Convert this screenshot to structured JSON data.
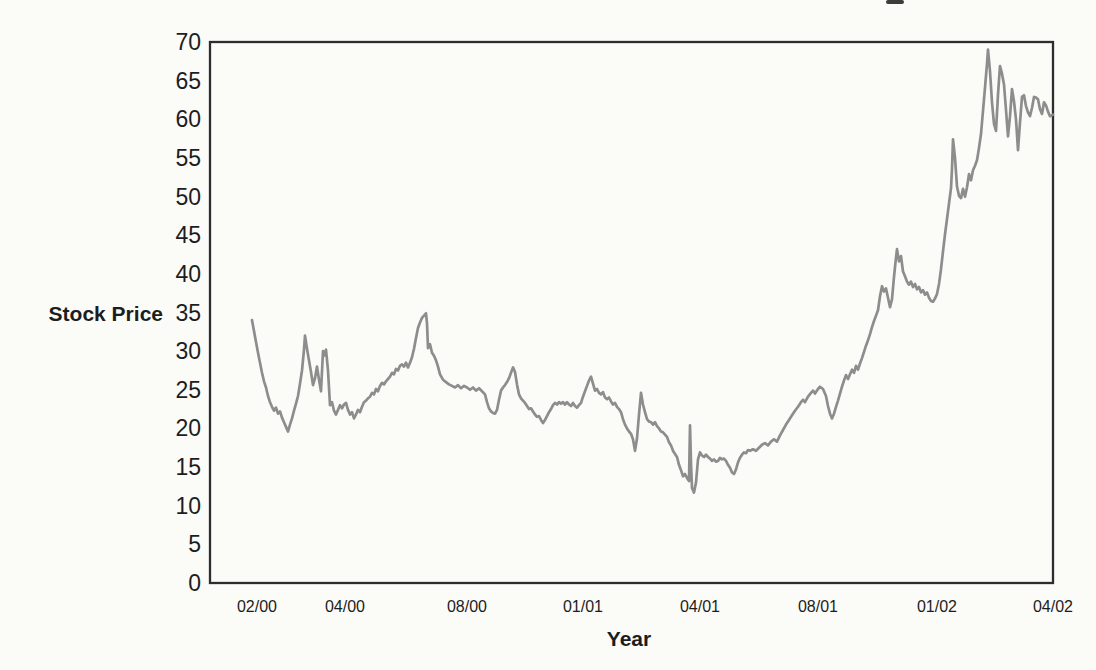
{
  "chart_data": {
    "type": "line",
    "title": "",
    "ylabel": "Stock Price",
    "xlabel": "Year",
    "ylim": [
      0,
      70
    ],
    "ytick_step": 5,
    "y_ticks": [
      0,
      5,
      10,
      15,
      20,
      25,
      30,
      35,
      40,
      45,
      50,
      55,
      60,
      65,
      70
    ],
    "x_tick_labels": [
      "02/00",
      "04/00",
      "08/00",
      "01/01",
      "04/01",
      "08/01",
      "01/02",
      "04/02"
    ],
    "x_tick_pos": [
      257,
      345,
      467,
      583,
      700,
      818,
      937,
      1053
    ],
    "x_domain": [
      210,
      1053
    ],
    "grid": false,
    "legend": "none",
    "colors": {
      "line": "#8d8d8d",
      "axis": "#2d2d2d",
      "text": "#1d1d1d",
      "background": "#fbfbf8",
      "artifact": "#3c3c3c"
    },
    "points": [
      [
        252,
        34
      ],
      [
        254,
        32.6
      ],
      [
        256,
        31.2
      ],
      [
        258,
        29.8
      ],
      [
        260,
        28.5
      ],
      [
        262,
        27.2
      ],
      [
        264,
        26.1
      ],
      [
        266,
        25.3
      ],
      [
        268,
        24.2
      ],
      [
        270,
        23.4
      ],
      [
        272,
        22.8
      ],
      [
        274,
        22.3
      ],
      [
        276,
        22.7
      ],
      [
        278,
        21.9
      ],
      [
        280,
        22.2
      ],
      [
        282,
        21.4
      ],
      [
        284,
        20.8
      ],
      [
        286,
        20.2
      ],
      [
        288,
        19.6
      ],
      [
        290,
        20.5
      ],
      [
        292,
        21.3
      ],
      [
        294,
        22.3
      ],
      [
        296,
        23.2
      ],
      [
        298,
        24.2
      ],
      [
        300,
        25.8
      ],
      [
        302,
        27.5
      ],
      [
        304,
        30.2
      ],
      [
        305,
        32
      ],
      [
        307,
        30.3
      ],
      [
        309,
        28.8
      ],
      [
        311,
        27.3
      ],
      [
        313,
        25.6
      ],
      [
        315,
        26.5
      ],
      [
        317,
        28
      ],
      [
        319,
        26.3
      ],
      [
        321,
        24.8
      ],
      [
        323,
        30
      ],
      [
        324,
        29.4
      ],
      [
        326,
        30.2
      ],
      [
        328,
        27.5
      ],
      [
        330,
        23
      ],
      [
        332,
        23.4
      ],
      [
        334,
        22.3
      ],
      [
        336,
        21.8
      ],
      [
        338,
        22.4
      ],
      [
        340,
        23
      ],
      [
        342,
        22.6
      ],
      [
        344,
        23.1
      ],
      [
        346,
        23.3
      ],
      [
        348,
        22.4
      ],
      [
        350,
        21.8
      ],
      [
        352,
        22.1
      ],
      [
        354,
        21.3
      ],
      [
        356,
        21.8
      ],
      [
        358,
        22.4
      ],
      [
        360,
        22.1
      ],
      [
        362,
        22.8
      ],
      [
        364,
        23.4
      ],
      [
        366,
        23.6
      ],
      [
        368,
        23.9
      ],
      [
        370,
        24.1
      ],
      [
        372,
        24.6
      ],
      [
        374,
        24.4
      ],
      [
        376,
        25.1
      ],
      [
        378,
        24.8
      ],
      [
        380,
        25.5
      ],
      [
        382,
        25.9
      ],
      [
        384,
        25.7
      ],
      [
        386,
        26.1
      ],
      [
        388,
        26.4
      ],
      [
        390,
        26.7
      ],
      [
        392,
        27.2
      ],
      [
        394,
        27
      ],
      [
        396,
        27.7
      ],
      [
        398,
        27.5
      ],
      [
        400,
        28.1
      ],
      [
        402,
        28.3
      ],
      [
        404,
        28
      ],
      [
        406,
        28.5
      ],
      [
        408,
        27.9
      ],
      [
        410,
        28.5
      ],
      [
        412,
        29.2
      ],
      [
        414,
        30.3
      ],
      [
        416,
        31.7
      ],
      [
        418,
        33
      ],
      [
        420,
        33.7
      ],
      [
        422,
        34.3
      ],
      [
        424,
        34.6
      ],
      [
        426,
        34.9
      ],
      [
        427,
        33.6
      ],
      [
        428,
        30.4
      ],
      [
        430,
        30.9
      ],
      [
        432,
        29.8
      ],
      [
        434,
        29.4
      ],
      [
        436,
        28.8
      ],
      [
        438,
        28
      ],
      [
        440,
        27
      ],
      [
        443,
        26.3
      ],
      [
        446,
        26
      ],
      [
        449,
        25.7
      ],
      [
        452,
        25.5
      ],
      [
        455,
        25.3
      ],
      [
        458,
        25.6
      ],
      [
        461,
        25.2
      ],
      [
        464,
        25.5
      ],
      [
        467,
        25.3
      ],
      [
        470,
        25
      ],
      [
        473,
        25.3
      ],
      [
        476,
        24.9
      ],
      [
        479,
        25.2
      ],
      [
        482,
        24.8
      ],
      [
        485,
        24.4
      ],
      [
        487,
        23.4
      ],
      [
        489,
        22.6
      ],
      [
        491,
        22.2
      ],
      [
        493,
        22
      ],
      [
        495,
        21.9
      ],
      [
        497,
        22.4
      ],
      [
        499,
        23.7
      ],
      [
        501,
        24.9
      ],
      [
        503,
        25.3
      ],
      [
        505,
        25.6
      ],
      [
        507,
        26
      ],
      [
        509,
        26.5
      ],
      [
        511,
        27.2
      ],
      [
        513,
        27.9
      ],
      [
        515,
        27.3
      ],
      [
        517,
        25.7
      ],
      [
        519,
        24.4
      ],
      [
        521,
        23.9
      ],
      [
        523,
        23.6
      ],
      [
        525,
        23.3
      ],
      [
        527,
        22.9
      ],
      [
        529,
        22.5
      ],
      [
        531,
        22.6
      ],
      [
        533,
        22.2
      ],
      [
        535,
        21.8
      ],
      [
        537,
        21.5
      ],
      [
        539,
        21.6
      ],
      [
        541,
        21.1
      ],
      [
        543,
        20.7
      ],
      [
        545,
        21.1
      ],
      [
        547,
        21.6
      ],
      [
        549,
        22.1
      ],
      [
        551,
        22.5
      ],
      [
        553,
        23
      ],
      [
        555,
        23.3
      ],
      [
        557,
        23.1
      ],
      [
        559,
        23.4
      ],
      [
        561,
        23.2
      ],
      [
        563,
        23.4
      ],
      [
        565,
        23.1
      ],
      [
        567,
        23.4
      ],
      [
        569,
        23.1
      ],
      [
        571,
        22.9
      ],
      [
        573,
        23.3
      ],
      [
        575,
        22.9
      ],
      [
        577,
        22.7
      ],
      [
        579,
        23
      ],
      [
        581,
        23.3
      ],
      [
        583,
        24.1
      ],
      [
        585,
        24.8
      ],
      [
        587,
        25.5
      ],
      [
        589,
        26.2
      ],
      [
        591,
        26.7
      ],
      [
        593,
        25.8
      ],
      [
        595,
        24.9
      ],
      [
        597,
        25.1
      ],
      [
        599,
        24.6
      ],
      [
        601,
        24.4
      ],
      [
        603,
        24.7
      ],
      [
        605,
        24
      ],
      [
        607,
        23.8
      ],
      [
        609,
        24
      ],
      [
        611,
        23.5
      ],
      [
        613,
        23.1
      ],
      [
        615,
        23.3
      ],
      [
        617,
        22.8
      ],
      [
        619,
        22.5
      ],
      [
        621,
        22.1
      ],
      [
        623,
        21.2
      ],
      [
        625,
        20.5
      ],
      [
        627,
        20
      ],
      [
        629,
        19.6
      ],
      [
        631,
        19.3
      ],
      [
        633,
        18.6
      ],
      [
        635,
        17.1
      ],
      [
        637,
        18.7
      ],
      [
        639,
        21.8
      ],
      [
        641,
        24.6
      ],
      [
        643,
        23.1
      ],
      [
        645,
        22.1
      ],
      [
        647,
        21.2
      ],
      [
        649,
        20.9
      ],
      [
        651,
        20.8
      ],
      [
        653,
        20.5
      ],
      [
        655,
        20.8
      ],
      [
        657,
        20.3
      ],
      [
        659,
        20
      ],
      [
        661,
        19.6
      ],
      [
        663,
        19.5
      ],
      [
        665,
        19.2
      ],
      [
        667,
        18.9
      ],
      [
        669,
        18.2
      ],
      [
        671,
        17.8
      ],
      [
        673,
        17.1
      ],
      [
        675,
        16.7
      ],
      [
        677,
        16.3
      ],
      [
        679,
        15.3
      ],
      [
        681,
        14.6
      ],
      [
        683,
        13.8
      ],
      [
        685,
        14.1
      ],
      [
        687,
        13.6
      ],
      [
        689,
        13.2
      ],
      [
        690,
        20.4
      ],
      [
        691,
        15.5
      ],
      [
        692,
        12.3
      ],
      [
        694,
        11.7
      ],
      [
        696,
        13
      ],
      [
        698,
        16
      ],
      [
        700,
        16.9
      ],
      [
        702,
        16.5
      ],
      [
        704,
        16.3
      ],
      [
        706,
        16.6
      ],
      [
        708,
        16.3
      ],
      [
        710,
        16.1
      ],
      [
        712,
        15.8
      ],
      [
        714,
        16
      ],
      [
        716,
        15.7
      ],
      [
        718,
        15.8
      ],
      [
        720,
        16.2
      ],
      [
        722,
        16
      ],
      [
        724,
        16.1
      ],
      [
        726,
        15.8
      ],
      [
        728,
        15.3
      ],
      [
        730,
        14.9
      ],
      [
        732,
        14.3
      ],
      [
        734,
        14.1
      ],
      [
        736,
        14.7
      ],
      [
        738,
        15.6
      ],
      [
        740,
        16.2
      ],
      [
        742,
        16.6
      ],
      [
        744,
        16.9
      ],
      [
        746,
        16.8
      ],
      [
        748,
        17.2
      ],
      [
        750,
        17.1
      ],
      [
        753,
        17.3
      ],
      [
        756,
        17.1
      ],
      [
        759,
        17.5
      ],
      [
        762,
        17.9
      ],
      [
        765,
        18.1
      ],
      [
        768,
        17.8
      ],
      [
        771,
        18.3
      ],
      [
        774,
        18.6
      ],
      [
        777,
        18.3
      ],
      [
        780,
        19.1
      ],
      [
        783,
        19.8
      ],
      [
        786,
        20.5
      ],
      [
        789,
        21.1
      ],
      [
        792,
        21.7
      ],
      [
        795,
        22.3
      ],
      [
        798,
        22.8
      ],
      [
        801,
        23.4
      ],
      [
        803,
        23.7
      ],
      [
        805,
        23.4
      ],
      [
        808,
        24.1
      ],
      [
        811,
        24.6
      ],
      [
        813,
        24.9
      ],
      [
        815,
        24.5
      ],
      [
        818,
        25.1
      ],
      [
        820,
        25.4
      ],
      [
        823,
        25.1
      ],
      [
        826,
        24.2
      ],
      [
        828,
        22.9
      ],
      [
        830,
        21.9
      ],
      [
        832,
        21.3
      ],
      [
        834,
        21.9
      ],
      [
        836,
        22.8
      ],
      [
        838,
        23.6
      ],
      [
        840,
        24.5
      ],
      [
        842,
        25.4
      ],
      [
        844,
        26.2
      ],
      [
        846,
        26.9
      ],
      [
        848,
        26.4
      ],
      [
        850,
        27
      ],
      [
        852,
        27.6
      ],
      [
        854,
        27.2
      ],
      [
        856,
        28.1
      ],
      [
        858,
        27.6
      ],
      [
        860,
        28.4
      ],
      [
        862,
        29.1
      ],
      [
        864,
        29.9
      ],
      [
        866,
        30.7
      ],
      [
        868,
        31.4
      ],
      [
        870,
        32.2
      ],
      [
        872,
        33.1
      ],
      [
        874,
        33.9
      ],
      [
        876,
        34.6
      ],
      [
        878,
        35.3
      ],
      [
        880,
        37.1
      ],
      [
        882,
        38.4
      ],
      [
        884,
        37.7
      ],
      [
        886,
        38.1
      ],
      [
        888,
        36.9
      ],
      [
        890,
        35.7
      ],
      [
        892,
        36.7
      ],
      [
        894,
        39.6
      ],
      [
        896,
        42.1
      ],
      [
        897,
        43.2
      ],
      [
        899,
        41.6
      ],
      [
        901,
        42.3
      ],
      [
        903,
        40.3
      ],
      [
        905,
        39.7
      ],
      [
        907,
        39
      ],
      [
        909,
        38.6
      ],
      [
        911,
        39
      ],
      [
        913,
        38.3
      ],
      [
        915,
        38.7
      ],
      [
        917,
        38
      ],
      [
        919,
        38.3
      ],
      [
        921,
        37.6
      ],
      [
        923,
        37.9
      ],
      [
        925,
        37.3
      ],
      [
        927,
        37.6
      ],
      [
        929,
        36.9
      ],
      [
        931,
        36.5
      ],
      [
        933,
        36.4
      ],
      [
        935,
        36.8
      ],
      [
        937,
        37.4
      ],
      [
        939,
        38.7
      ],
      [
        941,
        40.6
      ],
      [
        943,
        42.9
      ],
      [
        945,
        45.1
      ],
      [
        947,
        47.1
      ],
      [
        949,
        49.1
      ],
      [
        951,
        51.1
      ],
      [
        952,
        53.6
      ],
      [
        953,
        57.4
      ],
      [
        955,
        55
      ],
      [
        957,
        51.3
      ],
      [
        959,
        50.1
      ],
      [
        961,
        49.8
      ],
      [
        963,
        51
      ],
      [
        965,
        50
      ],
      [
        967,
        51.2
      ],
      [
        969,
        52.9
      ],
      [
        971,
        52.1
      ],
      [
        973,
        53.4
      ],
      [
        975,
        54
      ],
      [
        977,
        54.7
      ],
      [
        979,
        56.3
      ],
      [
        981,
        58.1
      ],
      [
        983,
        61.1
      ],
      [
        985,
        64.1
      ],
      [
        987,
        67.2
      ],
      [
        988,
        69
      ],
      [
        990,
        66.2
      ],
      [
        992,
        62.2
      ],
      [
        994,
        59.4
      ],
      [
        996,
        58.5
      ],
      [
        998,
        63.2
      ],
      [
        1000,
        66.9
      ],
      [
        1002,
        65.9
      ],
      [
        1004,
        64.5
      ],
      [
        1006,
        61.2
      ],
      [
        1008,
        57.8
      ],
      [
        1010,
        60.4
      ],
      [
        1012,
        63.9
      ],
      [
        1014,
        62.3
      ],
      [
        1016,
        60
      ],
      [
        1018,
        56
      ],
      [
        1020,
        59.6
      ],
      [
        1022,
        62.9
      ],
      [
        1024,
        63.1
      ],
      [
        1026,
        61.7
      ],
      [
        1028,
        60.9
      ],
      [
        1030,
        60.4
      ],
      [
        1032,
        61.5
      ],
      [
        1034,
        62.9
      ],
      [
        1036,
        62.8
      ],
      [
        1038,
        62.6
      ],
      [
        1040,
        61.3
      ],
      [
        1042,
        60.7
      ],
      [
        1044,
        62.2
      ],
      [
        1046,
        61.8
      ],
      [
        1048,
        61
      ],
      [
        1050,
        60.4
      ],
      [
        1053,
        60.6
      ]
    ]
  }
}
